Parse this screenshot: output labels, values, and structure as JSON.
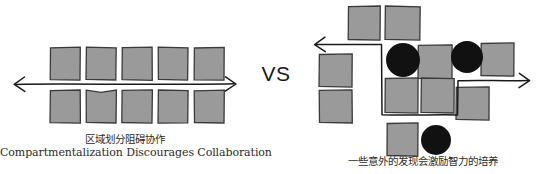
{
  "figure": {
    "background_color": "#ffffff",
    "square_fill": "#9a9a9a",
    "square_stroke": "#3a3a3a",
    "circle_fill": "#111111",
    "arrow_color": "#1a1a1a",
    "text_color": "#2b2b2b"
  },
  "divider": {
    "vs_label": "VS"
  },
  "left": {
    "name": "compartmentalized-layout",
    "caption_cn": "区域划分阻碍协作",
    "caption_en": "Compartmentalization Discourages Collaboration",
    "arrow": {
      "type": "double-headed-straight",
      "x1": 14,
      "x2": 236,
      "y": 84
    },
    "rows": [
      {
        "label": "top-row",
        "y": 47,
        "squares": [
          {
            "x": 50,
            "y": 47,
            "w": 30,
            "h": 33
          },
          {
            "x": 86,
            "y": 47,
            "w": 30,
            "h": 33
          },
          {
            "x": 122,
            "y": 47,
            "w": 30,
            "h": 33
          },
          {
            "x": 158,
            "y": 47,
            "w": 30,
            "h": 33
          },
          {
            "x": 194,
            "y": 47,
            "w": 30,
            "h": 33
          }
        ]
      },
      {
        "label": "bottom-row",
        "y": 90,
        "squares": [
          {
            "x": 50,
            "y": 90,
            "w": 30,
            "h": 33
          },
          {
            "x": 86,
            "y": 90,
            "w": 30,
            "h": 33
          },
          {
            "x": 122,
            "y": 90,
            "w": 30,
            "h": 33
          },
          {
            "x": 158,
            "y": 90,
            "w": 30,
            "h": 33
          },
          {
            "x": 194,
            "y": 90,
            "w": 30,
            "h": 33
          }
        ]
      }
    ]
  },
  "right": {
    "name": "serendipitous-layout",
    "caption_cn": "一些意外的发现会激励智力的培养",
    "arrow": {
      "type": "double-headed-zigzag",
      "description": "winding white corridor weaving between blocks",
      "start_head": "left-up",
      "end_head": "right"
    },
    "squares": [
      {
        "x": 48,
        "y": 6,
        "w": 32,
        "h": 34
      },
      {
        "x": 85,
        "y": 6,
        "w": 35,
        "h": 34
      },
      {
        "x": 19,
        "y": 54,
        "w": 33,
        "h": 33
      },
      {
        "x": 19,
        "y": 90,
        "w": 33,
        "h": 33
      },
      {
        "x": 118,
        "y": 45,
        "w": 34,
        "h": 34
      },
      {
        "x": 181,
        "y": 43,
        "w": 33,
        "h": 33
      },
      {
        "x": 85,
        "y": 78,
        "w": 33,
        "h": 35
      },
      {
        "x": 121,
        "y": 78,
        "w": 33,
        "h": 35
      },
      {
        "x": 156,
        "y": 87,
        "w": 33,
        "h": 33
      },
      {
        "x": 87,
        "y": 123,
        "w": 31,
        "h": 33
      }
    ],
    "circles": [
      {
        "cx": 103,
        "cy": 60,
        "r": 17
      },
      {
        "cx": 167,
        "cy": 57,
        "r": 16
      },
      {
        "cx": 136,
        "cy": 140,
        "r": 15
      }
    ]
  }
}
